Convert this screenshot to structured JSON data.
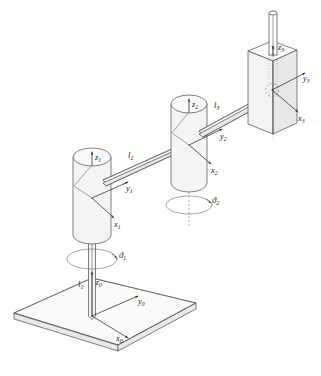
{
  "figure": {
    "kind": "technical-line-drawing",
    "background_color": "#ffffff",
    "line_color": "#4a4a4a",
    "fill_color": "#f4f4f4",
    "label_color": "#1a1a1a"
  },
  "frames": [
    {
      "id": "frame0",
      "name": "base-frame",
      "origin_label": "",
      "axes": [
        {
          "name": "x0",
          "symbol": "x",
          "subscript": "0"
        },
        {
          "name": "y0",
          "symbol": "y",
          "subscript": "0"
        },
        {
          "name": "z0",
          "symbol": "z",
          "subscript": "0"
        }
      ]
    },
    {
      "id": "frame1",
      "name": "link1-frame",
      "origin_label": "",
      "axes": [
        {
          "name": "x1",
          "symbol": "x",
          "subscript": "1"
        },
        {
          "name": "y1",
          "symbol": "y",
          "subscript": "1"
        },
        {
          "name": "z1",
          "symbol": "z",
          "subscript": "1"
        }
      ]
    },
    {
      "id": "frame2",
      "name": "link2-frame",
      "origin_label": "",
      "axes": [
        {
          "name": "x2",
          "symbol": "x",
          "subscript": "2"
        },
        {
          "name": "y2",
          "symbol": "y",
          "subscript": "2"
        },
        {
          "name": "z2",
          "symbol": "z",
          "subscript": "2"
        }
      ]
    },
    {
      "id": "frame3",
      "name": "end-effector-frame",
      "origin_label": "",
      "axes": [
        {
          "name": "x3",
          "symbol": "x",
          "subscript": "3"
        },
        {
          "name": "y3",
          "symbol": "y",
          "subscript": "3"
        },
        {
          "name": "z3",
          "symbol": "z",
          "subscript": "3"
        }
      ]
    }
  ],
  "links": [
    {
      "name": "link-l1",
      "symbol": "l",
      "subscript": "1",
      "description": "vertical base column"
    },
    {
      "name": "link-l2",
      "symbol": "l",
      "subscript": "2",
      "description": "first horizontal arm"
    },
    {
      "name": "link-l3",
      "symbol": "l",
      "subscript": "3",
      "description": "second horizontal arm"
    }
  ],
  "joints": [
    {
      "name": "joint-theta1",
      "symbol": "ϑ",
      "subscript": "1",
      "type": "revolute"
    },
    {
      "name": "joint-theta2",
      "symbol": "ϑ",
      "subscript": "2",
      "type": "revolute"
    }
  ],
  "parts": [
    {
      "name": "base-plate",
      "shape": "parallelogram-slab"
    },
    {
      "name": "base-column",
      "shape": "vertical-rod"
    },
    {
      "name": "shoulder-cylinder",
      "shape": "capsule"
    },
    {
      "name": "elbow-cylinder",
      "shape": "capsule"
    },
    {
      "name": "end-effector-prism",
      "shape": "rectangular-prism"
    },
    {
      "name": "end-effector-rod",
      "shape": "vertical-rod"
    }
  ]
}
